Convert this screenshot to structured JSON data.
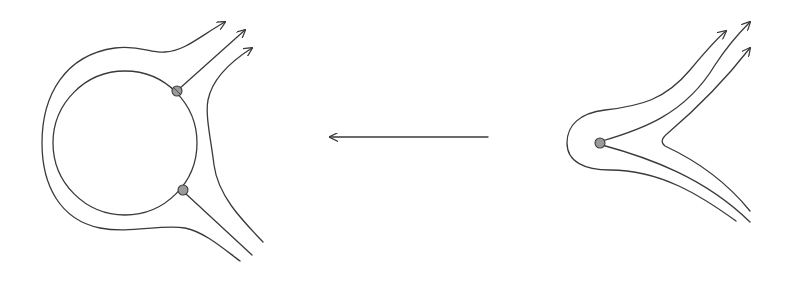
{
  "diagram": {
    "description": "Two flow-line figures connected by a leftward arrow: a ring with two attached points and enclosing streamlines (left), and a single point with a cusp-shaped streamline pattern (right).",
    "colors": {
      "background": "#ffffff",
      "line": "#3a3a3a",
      "point_fill": "#9a9a9a"
    },
    "left_figure": {
      "name": "ring-with-two-points",
      "inner_circle": {
        "cx": 125,
        "cy": 143,
        "r": 72
      },
      "points": [
        {
          "id": "upper-point",
          "x": 177,
          "y": 91
        },
        {
          "id": "lower-point",
          "x": 183,
          "y": 190
        }
      ],
      "outgoing_arrows": 3,
      "tail_lines": 3
    },
    "center_arrow": {
      "direction": "left",
      "x1": 488,
      "x2": 330,
      "y": 137
    },
    "right_figure": {
      "name": "single-point-with-cusp",
      "points": [
        {
          "id": "center-point",
          "x": 600,
          "y": 143
        }
      ],
      "outgoing_arrows": 3,
      "tail_lines": 3
    }
  }
}
